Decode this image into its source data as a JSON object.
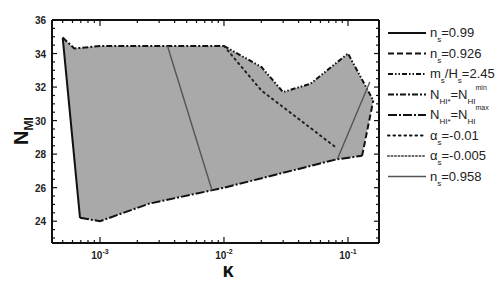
{
  "chart_data": {
    "type": "area",
    "title": "",
    "xlabel": "κ",
    "ylabel": "N_MI",
    "xscale": "log",
    "xlim": [
      0.00041,
      0.178
    ],
    "ylim": [
      22.7,
      36
    ],
    "x_ticks": [
      {
        "value": 0.001,
        "base": "10",
        "exp": "-3"
      },
      {
        "value": 0.01,
        "base": "10",
        "exp": "-2"
      },
      {
        "value": 0.1,
        "base": "10",
        "exp": "-1"
      }
    ],
    "y_ticks": [
      24,
      26,
      28,
      30,
      32,
      34,
      36
    ],
    "grid": false,
    "legend_position": "right-outside",
    "fill_color": "#a9a9a9",
    "region": {
      "name": "allowed region",
      "points": [
        [
          0.0005,
          34.95
        ],
        [
          0.00062,
          34.3
        ],
        [
          0.001,
          34.45
        ],
        [
          0.0025,
          34.45
        ],
        [
          0.01,
          34.45
        ],
        [
          0.02,
          33.2
        ],
        [
          0.03,
          31.7
        ],
        [
          0.05,
          32.2
        ],
        [
          0.1,
          34.0
        ],
        [
          0.16,
          31.2
        ],
        [
          0.13,
          27.9
        ],
        [
          0.082,
          27.7
        ],
        [
          0.01,
          26.0
        ],
        [
          0.0025,
          25.05
        ],
        [
          0.001,
          24.0
        ],
        [
          0.00069,
          24.2
        ]
      ]
    },
    "series": [
      {
        "name": "n_s=0.99",
        "style": "solid",
        "color": "#111111",
        "x": [
          0.0005,
          0.00069
        ],
        "y": [
          34.95,
          24.2
        ]
      },
      {
        "name": "n_s=0.926",
        "style": "dashed",
        "color": "#111111",
        "x": [
          0.13,
          0.16
        ],
        "y": [
          27.9,
          31.2
        ]
      },
      {
        "name": "m_s/H_s=2.45",
        "style": "dash-dot-dot",
        "color": "#111111",
        "x": [
          0.01,
          0.02,
          0.03,
          0.05,
          0.1,
          0.16
        ],
        "y": [
          34.45,
          33.2,
          31.7,
          32.2,
          34.0,
          31.2
        ]
      },
      {
        "name": "N_HI*=N_HI^min",
        "style": "dash-dot",
        "color": "#111111",
        "x": [
          0.0005,
          0.00062,
          0.001,
          0.0025,
          0.01
        ],
        "y": [
          34.95,
          34.3,
          34.45,
          34.45,
          34.45
        ]
      },
      {
        "name": "N_HI*=N_HI^max",
        "style": "dash-dot-long",
        "color": "#111111",
        "x": [
          0.00069,
          0.001,
          0.0025,
          0.01,
          0.082,
          0.13
        ],
        "y": [
          24.2,
          24.0,
          25.05,
          26.0,
          27.7,
          27.9
        ]
      },
      {
        "name": "α_s=-0.01",
        "style": "dotted-coarse",
        "color": "#222222",
        "x": [
          0.01,
          0.02,
          0.04,
          0.08
        ],
        "y": [
          34.45,
          31.8,
          30.1,
          28.4
        ]
      },
      {
        "name": "α_s=-0.005",
        "style": "dotted-fine",
        "color": "#555555",
        "x": [],
        "y": []
      },
      {
        "name": "n_s=0.958",
        "style": "solid-gray",
        "color": "#555555",
        "segments": [
          {
            "x": [
              0.0035,
              0.008
            ],
            "y": [
              34.45,
              25.85
            ]
          },
          {
            "x": [
              0.082,
              0.15
            ],
            "y": [
              27.7,
              32.3
            ]
          }
        ]
      }
    ],
    "legend": [
      {
        "label_main": "n",
        "label_sub": "s",
        "label_rest": "=0.99",
        "style": "solid"
      },
      {
        "label_main": "n",
        "label_sub": "s",
        "label_rest": "=0.926",
        "style": "dashed"
      },
      {
        "label_main": "m",
        "label_sub": "s",
        "label_mid": "/H",
        "label_sub2": "s",
        "label_rest": "=2.45",
        "style": "dash-dot-dot"
      },
      {
        "label_main": "N",
        "label_sub": "HI*",
        "label_mid": "=N",
        "label_sub2": "HI",
        "label_sup": "min",
        "style": "dash-dot"
      },
      {
        "label_main": "N",
        "label_sub": "HI*",
        "label_mid": "=N",
        "label_sub2": "HI",
        "label_sup": "max",
        "style": "dash-dot-long"
      },
      {
        "label_main": "α",
        "label_sub": "s",
        "label_rest": "=-0.01",
        "style": "dotted-coarse"
      },
      {
        "label_main": "α",
        "label_sub": "s",
        "label_rest": "=-0.005",
        "style": "dotted-fine"
      },
      {
        "label_main": "n",
        "label_sub": "s",
        "label_rest": "=0.958",
        "style": "solid-gray"
      }
    ]
  },
  "axes": {
    "x_title": "κ",
    "y_title_main": "N",
    "y_title_sub": "MI"
  }
}
